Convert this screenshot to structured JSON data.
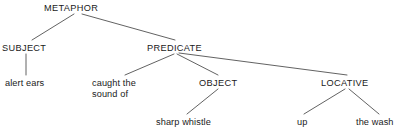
{
  "diagram": {
    "type": "tree",
    "width": 404,
    "height": 135,
    "background_color": "#ffffff",
    "line_color": "#3a3a3a",
    "text_color": "#1a1a1a"
  },
  "nodes": {
    "metaphor": {
      "label": "METAPHOR",
      "kind": "category",
      "x": 44,
      "y": 3
    },
    "subject": {
      "label": "SUBJECT",
      "kind": "category",
      "x": 2,
      "y": 43
    },
    "predicate": {
      "label": "PREDICATE",
      "kind": "category",
      "x": 147,
      "y": 43
    },
    "object": {
      "label": "OBJECT",
      "kind": "category",
      "x": 199,
      "y": 78
    },
    "locative": {
      "label": "LOCATIVE",
      "kind": "category",
      "x": 321,
      "y": 78
    },
    "alert_ears": {
      "label": "alert ears",
      "kind": "leaf",
      "x": 5,
      "y": 78
    },
    "caught_the_sound_of": {
      "label": "caught the\nsound of",
      "kind": "leaf",
      "x": 92,
      "y": 78
    },
    "sharp_whistle": {
      "label": "sharp whistle",
      "kind": "leaf",
      "x": 156,
      "y": 117
    },
    "up": {
      "label": "up",
      "kind": "leaf",
      "x": 297,
      "y": 117
    },
    "the_wash": {
      "label": "the wash",
      "kind": "leaf",
      "x": 356,
      "y": 117
    }
  },
  "edges": [
    {
      "from": "metaphor",
      "to": "subject",
      "x1": 74,
      "y1": 14,
      "x2": 32,
      "y2": 40
    },
    {
      "from": "metaphor",
      "to": "predicate",
      "x1": 82,
      "y1": 14,
      "x2": 175,
      "y2": 40
    },
    {
      "from": "subject",
      "to": "alert_ears",
      "x1": 26,
      "y1": 54,
      "x2": 26,
      "y2": 75
    },
    {
      "from": "predicate",
      "to": "caught_the_sound_of",
      "x1": 174,
      "y1": 54,
      "x2": 125,
      "y2": 75
    },
    {
      "from": "predicate",
      "to": "object",
      "x1": 177,
      "y1": 54,
      "x2": 218,
      "y2": 75
    },
    {
      "from": "predicate",
      "to": "locative",
      "x1": 179,
      "y1": 53,
      "x2": 347,
      "y2": 75
    },
    {
      "from": "object",
      "to": "sharp_whistle",
      "x1": 218,
      "y1": 89,
      "x2": 187,
      "y2": 114
    },
    {
      "from": "locative",
      "to": "up",
      "x1": 345,
      "y1": 89,
      "x2": 304,
      "y2": 114
    },
    {
      "from": "locative",
      "to": "the_wash",
      "x1": 349,
      "y1": 89,
      "x2": 379,
      "y2": 114
    }
  ]
}
